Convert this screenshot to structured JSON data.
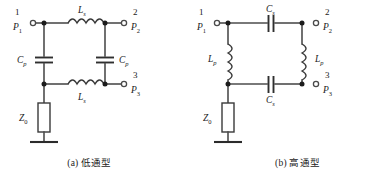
{
  "figure": {
    "background": "#ffffff",
    "wire_color": "#4d4d4d",
    "label_color": "#1a1a1a",
    "panels": [
      {
        "id": "a",
        "caption": "(a) 低通型",
        "topology": "low-pass",
        "ports": [
          {
            "number": "1",
            "name": "P",
            "subscript": "1",
            "side": "left",
            "row": "top"
          },
          {
            "number": "2",
            "name": "P",
            "subscript": "2",
            "side": "right",
            "row": "top"
          },
          {
            "number": "3",
            "name": "P",
            "subscript": "3",
            "side": "right",
            "row": "bottom"
          }
        ],
        "components": [
          {
            "kind": "inductor",
            "name": "L",
            "subscript": "s",
            "orientation": "horizontal",
            "branch": "series-top",
            "label_pos": "above"
          },
          {
            "kind": "inductor",
            "name": "L",
            "subscript": "s",
            "orientation": "horizontal",
            "branch": "series-bottom",
            "label_pos": "below"
          },
          {
            "kind": "capacitor",
            "name": "C",
            "subscript": "p",
            "orientation": "vertical",
            "branch": "shunt-left",
            "label_pos": "left"
          },
          {
            "kind": "capacitor",
            "name": "C",
            "subscript": "p",
            "orientation": "vertical",
            "branch": "shunt-right",
            "label_pos": "right"
          },
          {
            "kind": "resistor",
            "name": "Z",
            "subscript": "0",
            "orientation": "vertical",
            "branch": "termination",
            "label_pos": "left"
          }
        ],
        "ground": true
      },
      {
        "id": "b",
        "caption": "(b) 高通型",
        "topology": "high-pass",
        "ports": [
          {
            "number": "1",
            "name": "P",
            "subscript": "1",
            "side": "left",
            "row": "top"
          },
          {
            "number": "2",
            "name": "P",
            "subscript": "2",
            "side": "right",
            "row": "top"
          },
          {
            "number": "3",
            "name": "P",
            "subscript": "3",
            "side": "right",
            "row": "bottom"
          }
        ],
        "components": [
          {
            "kind": "capacitor",
            "name": "C",
            "subscript": "s",
            "orientation": "horizontal",
            "branch": "series-top",
            "label_pos": "above"
          },
          {
            "kind": "capacitor",
            "name": "C",
            "subscript": "s",
            "orientation": "horizontal",
            "branch": "series-bottom",
            "label_pos": "below"
          },
          {
            "kind": "inductor",
            "name": "L",
            "subscript": "p",
            "orientation": "vertical",
            "branch": "shunt-left",
            "label_pos": "left"
          },
          {
            "kind": "inductor",
            "name": "L",
            "subscript": "p",
            "orientation": "vertical",
            "branch": "shunt-right",
            "label_pos": "right"
          },
          {
            "kind": "resistor",
            "name": "Z",
            "subscript": "0",
            "orientation": "vertical",
            "branch": "termination",
            "label_pos": "left"
          }
        ],
        "ground": true
      }
    ]
  },
  "panel_a": {
    "port1_num": "1",
    "port1_name": "P",
    "port1_sub": "1",
    "port2_num": "2",
    "port2_name": "P",
    "port2_sub": "2",
    "port3_num": "3",
    "port3_name": "P",
    "port3_sub": "3",
    "ls_top_name": "L",
    "ls_top_sub": "s",
    "ls_bot_name": "L",
    "ls_bot_sub": "s",
    "cp_left_name": "C",
    "cp_left_sub": "p",
    "cp_right_name": "C",
    "cp_right_sub": "p",
    "z0_name": "Z",
    "z0_sub": "0",
    "caption": "(a) 低通型"
  },
  "panel_b": {
    "port1_num": "1",
    "port1_name": "P",
    "port1_sub": "1",
    "port2_num": "2",
    "port2_name": "P",
    "port2_sub": "2",
    "port3_num": "3",
    "port3_name": "P",
    "port3_sub": "3",
    "cs_top_name": "C",
    "cs_top_sub": "s",
    "cs_bot_name": "C",
    "cs_bot_sub": "s",
    "lp_left_name": "L",
    "lp_left_sub": "p",
    "lp_right_name": "L",
    "lp_right_sub": "p",
    "z0_name": "Z",
    "z0_sub": "0",
    "caption": "(b) 高通型"
  }
}
